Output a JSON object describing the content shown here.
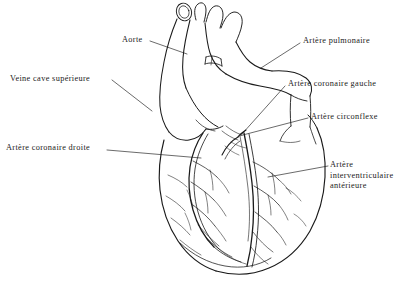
{
  "figure": {
    "background_color": "#ffffff",
    "ink_color": "#1a1a1a"
  },
  "labels": {
    "aorte": "Aorte",
    "veine_cave_superieure": "Veine cave supérieure",
    "artere_coronaire_droite": "Artère coronaire droite",
    "artere_pulmonaire": "Artère pulmonaire",
    "artere_coronaire_gauche": "Artère coronaire gauche",
    "artere_circonflexe": "Artère circonflexe",
    "artere_interventriculaire_anterieure": "Artère\ninterventriculaire\nantérieure"
  }
}
